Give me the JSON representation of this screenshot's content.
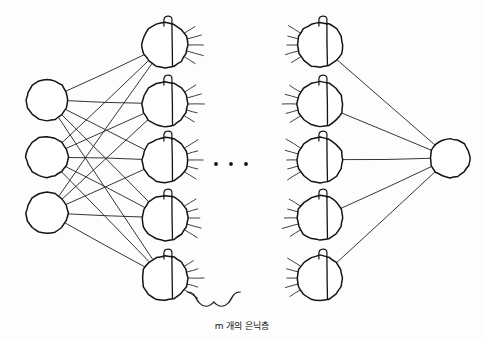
{
  "diagram": {
    "background_color": "#fdfdfd",
    "ink_color": "#1a1a1a",
    "caption": "m 개의 은닉층",
    "ellipsis": "• • •"
  },
  "input_layer": {
    "nodes": [
      {
        "id": "input-1",
        "label": "특성 1",
        "cx": 47,
        "cy": 100,
        "r": 21
      },
      {
        "id": "input-2",
        "label": "특성 2",
        "cx": 47,
        "cy": 157,
        "r": 21
      },
      {
        "id": "input-3",
        "label": "특성 3",
        "cx": 47,
        "cy": 213,
        "r": 21
      }
    ]
  },
  "hidden_layer_left": {
    "nodes": [
      {
        "id": "hidden-l-1",
        "sum_label": "가중치합",
        "unit_label": "은닉-1",
        "activation_label": "α",
        "bias_label": "바이어스",
        "cx": 165,
        "cy": 45,
        "r": 23
      },
      {
        "id": "hidden-l-2",
        "sum_label": "가중치합",
        "unit_label": "은닉-2",
        "activation_label": "α",
        "bias_label": "바이어스",
        "cx": 165,
        "cy": 104,
        "r": 23
      },
      {
        "id": "hidden-l-3",
        "sum_label": "가중치합",
        "unit_label": "은닉-3",
        "activation_label": "α",
        "bias_label": "바이어스",
        "cx": 165,
        "cy": 160,
        "r": 23
      },
      {
        "id": "hidden-l-4",
        "sum_label": "가중치합",
        "unit_label": "은닉-4",
        "activation_label": "α",
        "bias_label": "바이어스",
        "cx": 165,
        "cy": 218,
        "r": 23
      },
      {
        "id": "hidden-l-5",
        "sum_label": "가중치합",
        "unit_label": "은닉-5",
        "activation_label": "α",
        "bias_label": "바이어스",
        "cx": 165,
        "cy": 278,
        "r": 23
      }
    ]
  },
  "hidden_layer_right": {
    "nodes": [
      {
        "id": "hidden-r-1",
        "sum_label": "가중치합",
        "unit_label": "은닉-1",
        "activation_label": "α",
        "bias_label": "바이어스",
        "cx": 320,
        "cy": 45,
        "r": 23
      },
      {
        "id": "hidden-r-2",
        "sum_label": "가중치합",
        "unit_label": "은닉-2",
        "activation_label": "α",
        "bias_label": "바이어스",
        "cx": 320,
        "cy": 104,
        "r": 23
      },
      {
        "id": "hidden-r-3",
        "sum_label": "가중치합",
        "unit_label": "은닉-3",
        "activation_label": "α",
        "bias_label": "바이어스",
        "cx": 320,
        "cy": 160,
        "r": 23
      },
      {
        "id": "hidden-r-4",
        "sum_label": "가중치합",
        "unit_label": "은닉-4",
        "activation_label": "α",
        "bias_label": "바이어스",
        "cx": 320,
        "cy": 218,
        "r": 23
      },
      {
        "id": "hidden-r-5",
        "sum_label": "가중치합",
        "unit_label": "은닉-5",
        "activation_label": "α",
        "bias_label": "바이어스",
        "cx": 320,
        "cy": 278,
        "r": 23
      }
    ]
  },
  "output_layer": {
    "nodes": [
      {
        "id": "output-1",
        "label": "타겟",
        "cx": 450,
        "cy": 158,
        "r": 20
      }
    ]
  }
}
